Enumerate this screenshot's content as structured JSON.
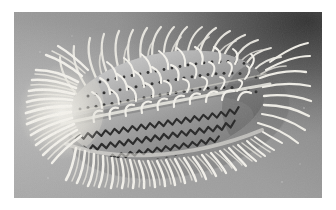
{
  "page": {
    "background_color": "#ffffff",
    "width": 336,
    "height": 210
  },
  "figure": {
    "kind": "scanning-electron-micrograph",
    "caption": "",
    "plate": {
      "left": 14,
      "top": 12,
      "width": 308,
      "height": 186,
      "background_color": "#9a9a9a",
      "background_light": "#b2b2b2",
      "background_dark": "#4a4a4a",
      "vignette_corner": "upper-right"
    },
    "specimen": {
      "outline_color": "#8d8d8d",
      "body_fill_light": "#bdbdbd",
      "body_fill_mid": "#9c9c9c",
      "body_fill_dark": "#6f6f6f",
      "cilia_color": "#f2f0ea",
      "basal_body_color": "#2b2b2b",
      "orientation": "long axis running lower-left to upper-right",
      "center_x": 150,
      "center_y": 95,
      "body_length": 200,
      "body_width": 104,
      "tilt_degrees": -12,
      "features": [
        "dense white ciliary fringe at anterior (left) end",
        "long curved dorsal cilia projecting upward",
        "rows of dark basal bodies (kineties) across dorsal surface",
        "zigzag sawtooth kinety rows on the ventral half",
        "dense ventral cirri fringe along lower margin",
        "cast shadow on the substrate at the upper right"
      ]
    },
    "kinety_rows": [
      {
        "id": "dorsal-row-1",
        "style": "dotted",
        "dots": 26
      },
      {
        "id": "dorsal-row-2",
        "style": "dotted",
        "dots": 28
      },
      {
        "id": "dorsal-row-3",
        "style": "dotted",
        "dots": 27
      },
      {
        "id": "mid-row-4",
        "style": "zigzag",
        "teeth": 30
      },
      {
        "id": "ventral-row-5",
        "style": "zigzag",
        "teeth": 32
      },
      {
        "id": "ventral-row-6",
        "style": "zigzag",
        "teeth": 30
      },
      {
        "id": "ventral-row-7",
        "style": "zigzag",
        "teeth": 28
      }
    ]
  }
}
